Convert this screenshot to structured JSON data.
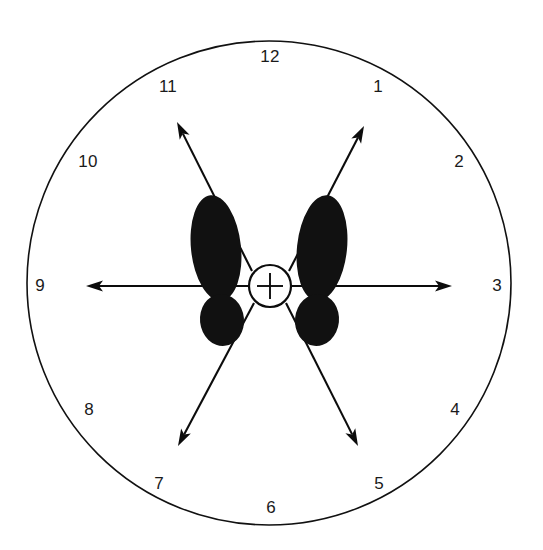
{
  "figure": {
    "kind": "clock-face-foot-position-diagram",
    "background_color": "#ffffff",
    "ink_color": "#111111"
  },
  "dial": {
    "center": {
      "x": 269,
      "y": 283
    },
    "radius": 242,
    "stroke_color": "#111111",
    "stroke_width": 1.6,
    "numbers": [
      {
        "label": "12",
        "hour": 12,
        "x": 270,
        "y": 58
      },
      {
        "label": "1",
        "hour": 1,
        "x": 378,
        "y": 88
      },
      {
        "label": "2",
        "hour": 2,
        "x": 459,
        "y": 163
      },
      {
        "label": "3",
        "hour": 3,
        "x": 497,
        "y": 287
      },
      {
        "label": "4",
        "hour": 4,
        "x": 455,
        "y": 411
      },
      {
        "label": "5",
        "hour": 5,
        "x": 379,
        "y": 485
      },
      {
        "label": "6",
        "hour": 6,
        "x": 271,
        "y": 509
      },
      {
        "label": "7",
        "hour": 7,
        "x": 159,
        "y": 485
      },
      {
        "label": "8",
        "hour": 8,
        "x": 89,
        "y": 411
      },
      {
        "label": "9",
        "hour": 9,
        "x": 40,
        "y": 287
      },
      {
        "label": "10",
        "hour": 10,
        "x": 88,
        "y": 163
      },
      {
        "label": "11",
        "hour": 11,
        "x": 168,
        "y": 88
      }
    ]
  },
  "hub": {
    "name": "center-reference-point",
    "center": {
      "x": 270,
      "y": 286
    },
    "radius": 21,
    "cross_arm_length": 13,
    "fill": "#ffffff",
    "stroke": "#0c0c0c"
  },
  "rays": [
    {
      "name": "ray-11-oclock",
      "hour": 11,
      "tip": {
        "x": 177,
        "y": 122
      },
      "tail": {
        "x": 252,
        "y": 271
      },
      "double_headed": false
    },
    {
      "name": "ray-1-oclock",
      "hour": 1,
      "tip": {
        "x": 364,
        "y": 126
      },
      "tail": {
        "x": 289,
        "y": 271
      },
      "double_headed": false
    },
    {
      "name": "ray-9-oclock",
      "hour": 9,
      "tip": {
        "x": 86,
        "y": 286
      },
      "tail": {
        "x": 248,
        "y": 286
      },
      "double_headed": false
    },
    {
      "name": "ray-3-oclock",
      "hour": 3,
      "tip": {
        "x": 452,
        "y": 286
      },
      "tail": {
        "x": 292,
        "y": 286
      },
      "double_headed": false
    },
    {
      "name": "ray-7-oclock",
      "hour": 7,
      "tip": {
        "x": 178,
        "y": 446
      },
      "tail": {
        "x": 254,
        "y": 303
      },
      "double_headed": false
    },
    {
      "name": "ray-5-oclock",
      "hour": 5,
      "tip": {
        "x": 358,
        "y": 446
      },
      "tail": {
        "x": 286,
        "y": 303
      },
      "double_headed": false
    }
  ],
  "ray_extensions": {
    "left_line_end": {
      "x": 250,
      "y": 286
    },
    "right_line_end": {
      "x": 500,
      "y": 286
    }
  },
  "left_foot": {
    "name": "left-footprint",
    "sole": {
      "cx": 216,
      "cy": 248,
      "rx": 25,
      "ry": 53,
      "rotate": -6
    },
    "heel": {
      "cx": 222,
      "cy": 320,
      "rx": 22,
      "ry": 26,
      "rotate": -6
    },
    "gap_y": 292
  },
  "right_foot": {
    "name": "right-footprint",
    "sole": {
      "cx": 322,
      "cy": 248,
      "rx": 25,
      "ry": 53,
      "rotate": 6
    },
    "heel": {
      "cx": 317,
      "cy": 320,
      "rx": 22,
      "ry": 26,
      "rotate": 6
    },
    "gap_y": 292
  },
  "arrow_head": {
    "length": 17,
    "half_width": 5.5,
    "notch": 4
  }
}
